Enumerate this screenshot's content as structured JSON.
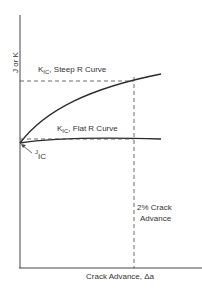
{
  "diagram": {
    "y_axis_label": "J or K",
    "x_axis_label": "Crack Advance, Δa",
    "steep_curve_label": {
      "main": "K",
      "sub": "IC",
      "rest": ", Steep R Curve"
    },
    "flat_curve_label": {
      "main": "K",
      "sub": "IC",
      "rest": ", Flat R Curve"
    },
    "jic_label": {
      "main": "J",
      "sub": "IC"
    },
    "crack_advance_marker": {
      "line1": "2% Crack",
      "line2": "Advance"
    },
    "colors": {
      "line": "#2a2a2a",
      "background": "#ffffff"
    }
  }
}
